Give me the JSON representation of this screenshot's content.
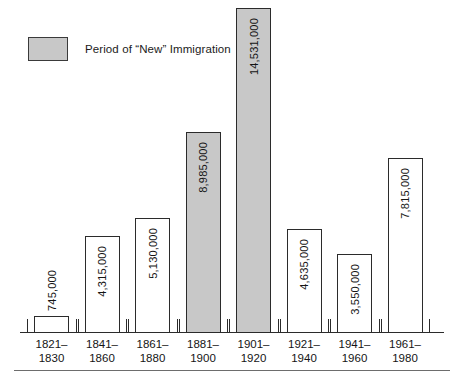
{
  "legend": {
    "label": "Period of “New” Immigration",
    "swatch_color": "#c8c8c8",
    "swatch_name": "legend-swatch"
  },
  "axis": {
    "baseline_color": "#2b2b2b",
    "bottom_rule_color": "#6d6d6d"
  },
  "chart_data": {
    "type": "bar",
    "title": "",
    "subtitle": "",
    "xlabel": "",
    "ylabel": "",
    "grid": false,
    "legend_position": "top-left",
    "ylim": [
      0,
      14531000
    ],
    "categories": [
      "1821–1830",
      "1841–1860",
      "1861–1880",
      "1881–1900",
      "1901–1920",
      "1921–1940",
      "1941–1960",
      "1961–1980"
    ],
    "category_lines": [
      [
        "1821–",
        "1830"
      ],
      [
        "1841–",
        "1860"
      ],
      [
        "1861–",
        "1880"
      ],
      [
        "1881–",
        "1900"
      ],
      [
        "1901–",
        "1920"
      ],
      [
        "1921–",
        "1940"
      ],
      [
        "1941–",
        "1960"
      ],
      [
        "1961–",
        "1980"
      ]
    ],
    "values": [
      745000,
      4315000,
      5130000,
      8985000,
      14531000,
      4635000,
      3550000,
      7815000
    ],
    "value_labels": [
      "745,000",
      "4,315,000",
      "5,130,000",
      "8,985,000",
      "14,531,000",
      "4,635,000",
      "3,550,000",
      "7,815,000"
    ],
    "highlighted": [
      false,
      false,
      false,
      true,
      true,
      false,
      false,
      false
    ],
    "label_placement": [
      "outside",
      "inside",
      "inside",
      "inside",
      "inside",
      "inside",
      "inside",
      "inside"
    ],
    "bar_fill_normal": "#ffffff",
    "bar_fill_highlight": "#c8c8c8",
    "bar_outline": "#2b2b2b"
  }
}
